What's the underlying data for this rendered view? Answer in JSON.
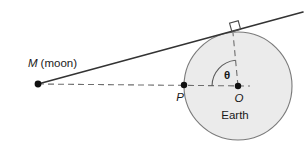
{
  "figure": {
    "type": "geometry-diagram",
    "background_color": "#ffffff"
  },
  "labels": {
    "moon": "M (moon)",
    "moon_symbol": "M",
    "moon_word": "(moon)",
    "point_p": "P",
    "point_o": "O",
    "theta": "θ",
    "earth": "Earth"
  },
  "colors": {
    "stroke": "#3a3a3a",
    "earth_fill": "#ebebeb",
    "earth_stroke": "#7a7a7a",
    "dashed": "#6e6e6e",
    "text": "#1a1a1a",
    "point_fill": "#111111"
  },
  "geometry": {
    "earth_circle": {
      "cx": 238,
      "cy": 86,
      "r": 54
    },
    "moon_point": {
      "x": 38,
      "y": 84
    },
    "point_p": {
      "x": 184,
      "y": 85
    },
    "point_o": {
      "x": 238,
      "y": 86
    },
    "tangent_point": {
      "x": 233,
      "y": 32
    },
    "tangent_line": {
      "x1": 38,
      "y1": 84,
      "x2": 302,
      "y2": 12
    },
    "sight_line_dashed": {
      "x1": 38,
      "y1": 84,
      "x2": 238,
      "y2": 86
    },
    "radius_dashed": {
      "x1": 238,
      "y1": 86,
      "x2": 233,
      "y2": 32
    },
    "angle_arc_radius": 26,
    "right_angle_marker_size": 8
  }
}
